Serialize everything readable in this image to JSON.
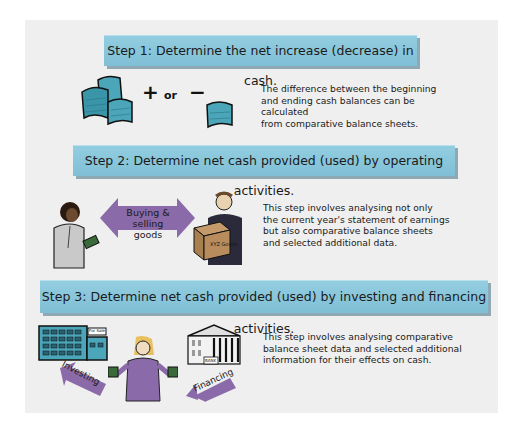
{
  "colors": {
    "banner": "#8ac8dc",
    "arrow": "#8a6aa8",
    "cash": "#4aa6b8",
    "panel": "#efefef"
  },
  "step1": {
    "title": "Step 1: Determine the net increase (decrease) in cash.",
    "plus": "+",
    "or": "or",
    "minus": "−",
    "description": "The difference between the beginning\nand ending cash balances can be calculated\nfrom comparative balance sheets."
  },
  "step2": {
    "title": "Step 2: Determine net cash provided (used) by operating activities.",
    "arrow_label": "Buying & selling\ngoods",
    "box_label": "XYZ Goods",
    "description": "This step involves analysing not only\nthe current year's statement of earnings\nbut also comparative balance sheets\nand selected additional data."
  },
  "step3": {
    "title": "Step 3: Determine net cash provided (used) by investing and financing activities.",
    "building_sign": "For Sale",
    "bank_sign": "BANK",
    "investing_label": "Investing",
    "financing_label": "Financing",
    "description": "This step involves analysing comparative\nbalance sheet data and selected additional\ninformation for their effects on cash."
  }
}
